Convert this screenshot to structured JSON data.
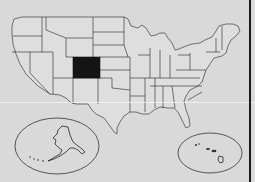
{
  "map": {
    "title": "United States",
    "highlighted_state": "Colorado",
    "colors": {
      "background": "#d9d9d9",
      "state_fill": "#dedede",
      "state_border": "#222222",
      "highlight": "#141414"
    },
    "insets": [
      {
        "name": "Alaska",
        "shape": "ellipse"
      },
      {
        "name": "Hawaii",
        "shape": "ellipse"
      }
    ]
  }
}
